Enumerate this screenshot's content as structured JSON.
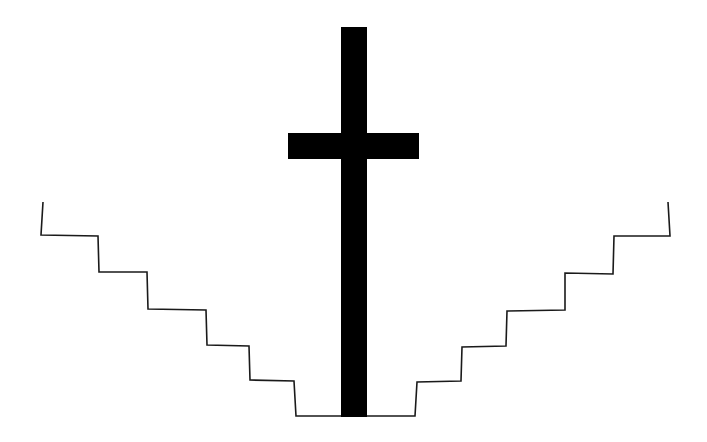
{
  "figure": {
    "width": 707,
    "height": 442,
    "background": "#ffffff",
    "stroke_color": "#1a1a1a",
    "fill_color": "#000000",
    "cross": {
      "vertical_bar": {
        "x": 341,
        "y": 27,
        "width": 26,
        "height": 390
      },
      "horizontal_bar": {
        "x": 288,
        "y": 133,
        "width": 131,
        "height": 26
      }
    },
    "left_stairs": {
      "points": "43,202 41,235 98,236 99,272 147,272 148,309 206,310 207,345 249,346 250,380 294,381 296,416 341,416"
    },
    "right_stairs": {
      "points": "367,416 415,416 417,382 461,381 462,347 506,346 507,311 565,310 565,273 613,274 614,236 670,236 668,202"
    }
  }
}
